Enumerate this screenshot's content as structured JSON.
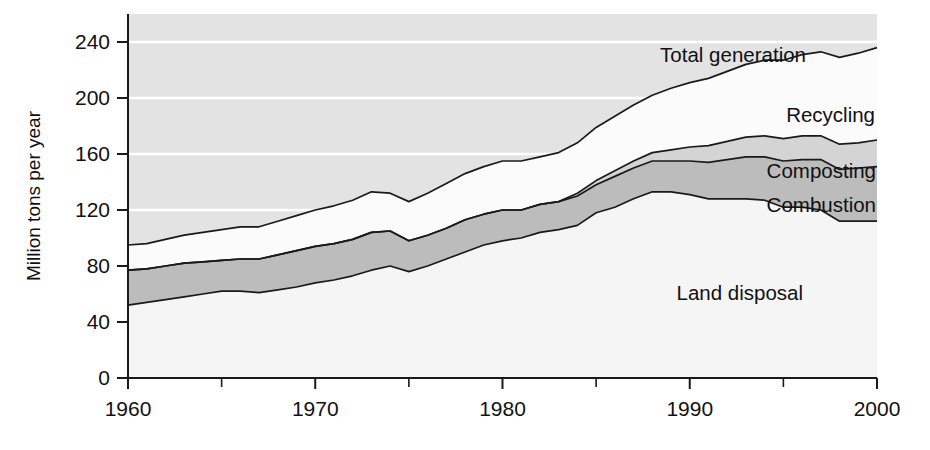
{
  "chart_data": {
    "type": "area",
    "title": "",
    "subtitle": "",
    "xlabel": "",
    "ylabel": "Million tons per year",
    "xlim": [
      1960,
      2000
    ],
    "ylim": [
      0,
      260
    ],
    "yticks": [
      0,
      40,
      80,
      120,
      160,
      200,
      240
    ],
    "ytick_labels": [
      "0",
      "40",
      "80",
      "120",
      "160",
      "200",
      "240"
    ],
    "xticks": [
      1960,
      1970,
      1980,
      1990,
      2000
    ],
    "xtick_labels": [
      "1960",
      "1970",
      "1980",
      "1990",
      "2000"
    ],
    "xminor_ticks": [
      1965,
      1975,
      1985,
      1995
    ],
    "grid": "horizontal-white-gridlines",
    "legend": "inline-area-labels",
    "stacked": true,
    "stack_order_bottom_to_top": [
      "Land disposal",
      "Combustion",
      "Composting",
      "Recycling"
    ],
    "x": [
      1960,
      1961,
      1962,
      1963,
      1964,
      1965,
      1966,
      1967,
      1968,
      1969,
      1970,
      1971,
      1972,
      1973,
      1974,
      1975,
      1976,
      1977,
      1978,
      1979,
      1980,
      1981,
      1982,
      1983,
      1984,
      1985,
      1986,
      1987,
      1988,
      1989,
      1990,
      1991,
      1992,
      1993,
      1994,
      1995,
      1996,
      1997,
      1998,
      1999,
      2000
    ],
    "series": [
      {
        "name": "Land disposal",
        "fill": "#f5f5f5",
        "values": [
          52,
          54,
          56,
          58,
          60,
          62,
          62,
          61,
          63,
          65,
          68,
          70,
          73,
          77,
          80,
          76,
          80,
          85,
          90,
          95,
          98,
          100,
          104,
          106,
          109,
          118,
          122,
          128,
          133,
          133,
          131,
          128,
          128,
          128,
          127,
          122,
          122,
          120,
          112,
          112,
          112
        ]
      },
      {
        "name": "Combustion",
        "fill": "#bcbcbc",
        "values": [
          25,
          24,
          24,
          24,
          23,
          22,
          23,
          24,
          25,
          26,
          26,
          26,
          26,
          27,
          25,
          22,
          22,
          22,
          23,
          22,
          22,
          20,
          20,
          20,
          21,
          20,
          22,
          22,
          22,
          22,
          24,
          26,
          28,
          30,
          31,
          33,
          34,
          36,
          37,
          38,
          39
        ]
      },
      {
        "name": "Composting",
        "fill": "#d4d4d4",
        "values": [
          0,
          0,
          0,
          0,
          0,
          0,
          0,
          0,
          0,
          0,
          0,
          0,
          0,
          0,
          0,
          0,
          0,
          0,
          0,
          0,
          0,
          0,
          0,
          0,
          2,
          3,
          4,
          5,
          6,
          8,
          10,
          12,
          13,
          14,
          15,
          16,
          17,
          17,
          18,
          18,
          19
        ]
      },
      {
        "name": "Recycling",
        "fill": "#fbfbfb",
        "values": [
          18,
          18,
          19,
          20,
          21,
          22,
          23,
          23,
          24,
          25,
          26,
          27,
          28,
          29,
          27,
          28,
          30,
          32,
          33,
          34,
          35,
          35,
          34,
          35,
          36,
          38,
          39,
          40,
          41,
          44,
          46,
          48,
          50,
          52,
          54,
          56,
          58,
          60,
          62,
          64,
          66
        ]
      }
    ],
    "totals": [
      95,
      96,
      99,
      102,
      104,
      106,
      108,
      108,
      112,
      116,
      120,
      123,
      127,
      133,
      132,
      126,
      132,
      139,
      146,
      151,
      155,
      155,
      158,
      161,
      168,
      179,
      187,
      195,
      202,
      207,
      211,
      214,
      219,
      224,
      227,
      227,
      231,
      233,
      229,
      232,
      236
    ],
    "annotations": [
      {
        "text": "Total generation",
        "x_px": 931,
        "y_px": 58,
        "anchor_series": "Total generation"
      },
      {
        "text": "Recycling",
        "x_px": 950,
        "y_px": 119,
        "anchor_series": "Recycling"
      },
      {
        "text": "Composting",
        "x_px": 953,
        "y_px": 172,
        "anchor_series": "Composting"
      },
      {
        "text": "Combustion",
        "x_px": 952,
        "y_px": 207,
        "anchor_series": "Combustion"
      },
      {
        "text": "Land disposal",
        "x_px": 805,
        "y_px": 294,
        "anchor_series": "Land disposal"
      }
    ]
  },
  "colors": {
    "plot_background": "#e3e3e3",
    "gridline": "#ffffff",
    "axis": "#1a1a1a",
    "outline": "#1a1a1a",
    "land_disposal": "#f5f5f5",
    "combustion": "#bcbcbc",
    "composting": "#d4d4d4",
    "recycling": "#fbfbfb",
    "page_background": "#ffffff"
  }
}
